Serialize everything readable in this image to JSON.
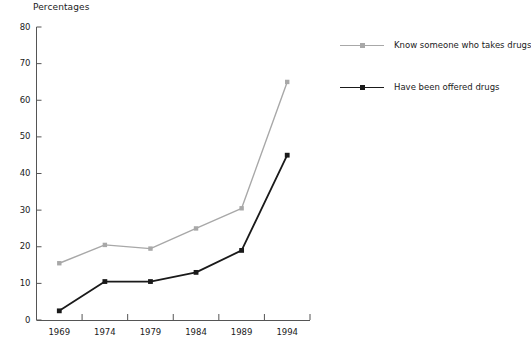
{
  "chart_data": {
    "type": "line",
    "title": "",
    "ylabel": "Percentages",
    "xlabel": "",
    "categories": [
      "1969",
      "1974",
      "1979",
      "1984",
      "1989",
      "1994"
    ],
    "ylim": [
      0,
      80
    ],
    "yticks": [
      0,
      10,
      20,
      30,
      40,
      50,
      60,
      70,
      80
    ],
    "grid": false,
    "legend_position": "right",
    "series": [
      {
        "name": "Know someone who takes drugs",
        "color": "#a8a8a8",
        "marker": "square",
        "values": [
          15.5,
          20.5,
          19.5,
          25,
          30.5,
          65
        ]
      },
      {
        "name": "Have been offered drugs",
        "color": "#1a1a1a",
        "marker": "square",
        "values": [
          2.5,
          10.5,
          10.5,
          13,
          19,
          45
        ]
      }
    ]
  },
  "axis": {
    "y_title": "Percentages",
    "y_tick_labels": [
      "80",
      "70",
      "60",
      "50",
      "40",
      "30",
      "20",
      "10",
      "0"
    ],
    "x_tick_labels": [
      "1969",
      "1974",
      "1979",
      "1984",
      "1989",
      "1994"
    ]
  },
  "legend": {
    "items": [
      {
        "label": "Know someone who takes drugs",
        "color": "#a8a8a8"
      },
      {
        "label": "Have been offered drugs",
        "color": "#1a1a1a"
      }
    ]
  }
}
